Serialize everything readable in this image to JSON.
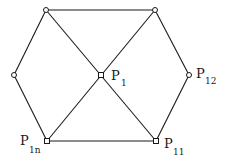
{
  "diagram": {
    "type": "graph",
    "stroke_color": "#1a1a1a",
    "background": "#ffffff",
    "nodes": [
      {
        "id": "top_left",
        "x": 46,
        "y": 10,
        "shape": "circle",
        "label": ""
      },
      {
        "id": "top_right",
        "x": 155,
        "y": 10,
        "shape": "circle",
        "label": ""
      },
      {
        "id": "left",
        "x": 14,
        "y": 75,
        "shape": "circle",
        "label": ""
      },
      {
        "id": "center",
        "x": 101,
        "y": 75,
        "shape": "square",
        "label": "P",
        "subscript": "1"
      },
      {
        "id": "right",
        "x": 189,
        "y": 75,
        "shape": "circle",
        "label": "P",
        "subscript": "12"
      },
      {
        "id": "bottom_left",
        "x": 47,
        "y": 141,
        "shape": "square",
        "label": "P",
        "subscript": "1n"
      },
      {
        "id": "bottom_right",
        "x": 156,
        "y": 141,
        "shape": "square",
        "label": "P",
        "subscript": "11"
      }
    ],
    "edges": [
      [
        "top_left",
        "top_right"
      ],
      [
        "top_right",
        "right"
      ],
      [
        "right",
        "bottom_right"
      ],
      [
        "bottom_right",
        "bottom_left"
      ],
      [
        "bottom_left",
        "left"
      ],
      [
        "left",
        "top_left"
      ],
      [
        "top_left",
        "bottom_right"
      ],
      [
        "top_right",
        "bottom_left"
      ]
    ],
    "labels": {
      "center": {
        "main": "P",
        "sub": "1"
      },
      "right": {
        "main": "P",
        "sub": "12"
      },
      "bottom_left": {
        "main": "P",
        "sub": "1n"
      },
      "bottom_right": {
        "main": "P",
        "sub": "11"
      }
    }
  }
}
